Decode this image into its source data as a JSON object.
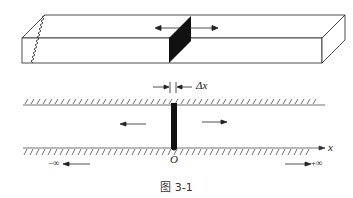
{
  "figure": {
    "caption": "图 3-1",
    "labels": {
      "delta_x": "Δx",
      "axis_x": "x",
      "origin": "O",
      "neg_inf": "−∞",
      "pos_inf": "+∞"
    },
    "colors": {
      "stroke": "#222222",
      "fill_dark": "#111111"
    }
  }
}
